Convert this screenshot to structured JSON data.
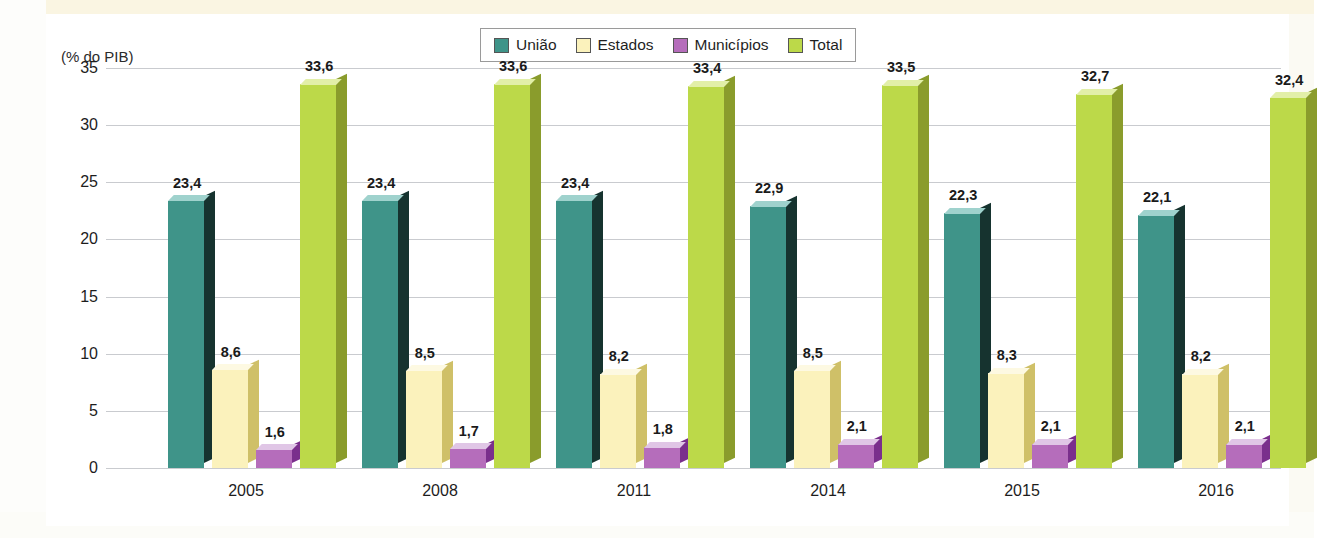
{
  "credit": "Gráficos: Ericson Guilherme Luciano/Arquivo da editora",
  "axis_title": "(% do PIB)",
  "legend": {
    "items": [
      {
        "label": "União",
        "color": "#3f9489",
        "side": "#16332f",
        "top": "#9fd2cd"
      },
      {
        "label": "Estados",
        "color": "#fbf2bc",
        "side": "#cfc068",
        "top": "#fdf9e2"
      },
      {
        "label": "Municípios",
        "color": "#b56dbb",
        "side": "#7a2f8c",
        "top": "#e0c6e6"
      },
      {
        "label": "Total",
        "color": "#bcd949",
        "side": "#8a9c2c",
        "top": "#e2efa8"
      }
    ]
  },
  "chart_data": {
    "type": "bar",
    "title": "",
    "subtitle": "",
    "xlabel": "",
    "ylabel": "(% do PIB)",
    "ylim": [
      0,
      35
    ],
    "yticks": [
      0,
      5,
      10,
      15,
      20,
      25,
      30,
      35
    ],
    "ytick_labels": [
      "0",
      "5",
      "10",
      "15",
      "20",
      "25",
      "30",
      "35"
    ],
    "grid": true,
    "legend_position": "top-center",
    "categories": [
      "2005",
      "2008",
      "2011",
      "2014",
      "2015",
      "2016"
    ],
    "series": [
      {
        "name": "União",
        "values": [
          23.4,
          23.4,
          23.4,
          22.9,
          22.3,
          22.1
        ],
        "labels": [
          "23,4",
          "23,4",
          "23,4",
          "22,9",
          "22,3",
          "22,1"
        ]
      },
      {
        "name": "Estados",
        "values": [
          8.6,
          8.5,
          8.2,
          8.5,
          8.3,
          8.2
        ],
        "labels": [
          "8,6",
          "8,5",
          "8,2",
          "8,5",
          "8,3",
          "8,2"
        ]
      },
      {
        "name": "Municípios",
        "values": [
          1.6,
          1.7,
          1.8,
          2.1,
          2.1,
          2.1
        ],
        "labels": [
          "1,6",
          "1,7",
          "1,8",
          "2,1",
          "2,1",
          "2,1"
        ]
      },
      {
        "name": "Total",
        "values": [
          33.6,
          33.6,
          33.4,
          33.5,
          32.7,
          32.4
        ],
        "labels": [
          "33,6",
          "33,6",
          "33,4",
          "33,5",
          "32,7",
          "32,4"
        ]
      }
    ]
  }
}
